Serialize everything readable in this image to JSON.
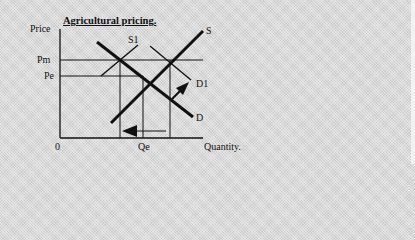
{
  "diagram": {
    "title": "Agricultural pricing.",
    "y_axis_label": "Price",
    "x_axis_label": "Quantity.",
    "origin_label": "0",
    "price_labels": {
      "pm": "Pm",
      "pe": "Pe"
    },
    "quantity_labels": {
      "qe": "Qe"
    },
    "curve_labels": {
      "s": "S",
      "s1": "S1",
      "d": "D",
      "d1": "D1"
    },
    "colors": {
      "background": "#d9d9d9",
      "ink": "#111111"
    }
  }
}
